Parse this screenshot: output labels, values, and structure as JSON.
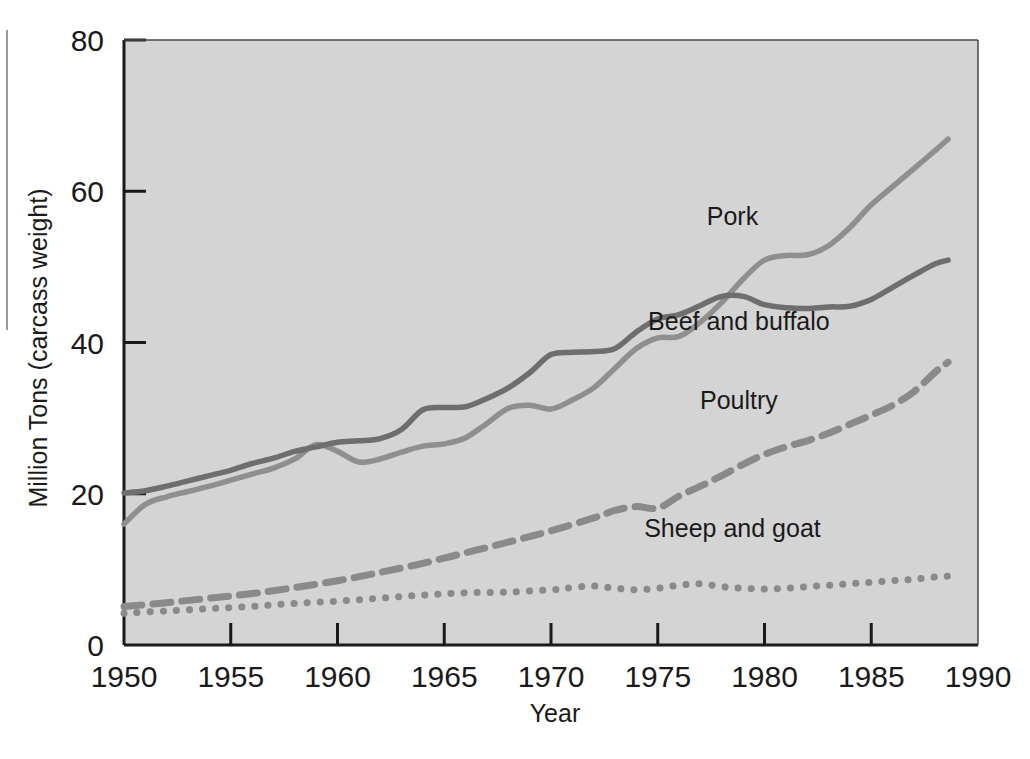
{
  "chart_data": {
    "type": "line",
    "title": "",
    "xlabel": "Year",
    "ylabel": "Million Tons (carcass weight)",
    "xlim": [
      1950,
      1990
    ],
    "ylim": [
      0,
      80
    ],
    "xticks": [
      "1950",
      "1955",
      "1960",
      "1965",
      "1970",
      "1975",
      "1980",
      "1985",
      "1990"
    ],
    "yticks": [
      "0",
      "20",
      "40",
      "60",
      "80"
    ],
    "grid": false,
    "legend_position": "inline-annotations",
    "plot_background": "#d4d4d4",
    "series": [
      {
        "name": "Pork",
        "label": "Pork",
        "style": "solid",
        "color": "#8f8f8f",
        "x": [
          1950,
          1951,
          1952,
          1953,
          1954,
          1955,
          1956,
          1957,
          1958,
          1959,
          1960,
          1961,
          1962,
          1963,
          1964,
          1965,
          1966,
          1967,
          1968,
          1969,
          1970,
          1971,
          1972,
          1973,
          1974,
          1975,
          1976,
          1977,
          1978,
          1979,
          1980,
          1981,
          1982,
          1983,
          1984,
          1985,
          1986,
          1987,
          1988,
          1988.6
        ],
        "values": [
          16.0,
          18.6,
          19.6,
          20.3,
          21.0,
          21.8,
          22.6,
          23.4,
          24.6,
          26.5,
          25.6,
          24.2,
          24.6,
          25.5,
          26.3,
          26.6,
          27.4,
          29.3,
          31.3,
          31.7,
          31.2,
          32.4,
          34.0,
          36.6,
          39.2,
          40.6,
          40.8,
          42.7,
          45.3,
          48.4,
          50.9,
          51.5,
          51.6,
          52.8,
          55.2,
          58.2,
          60.6,
          63.0,
          65.4,
          66.9
        ]
      },
      {
        "name": "Beef and buffalo",
        "label": "Beef and buffalo",
        "style": "solid",
        "color": "#6e6e6e",
        "x": [
          1950,
          1951,
          1952,
          1953,
          1954,
          1955,
          1956,
          1957,
          1958,
          1959,
          1960,
          1961,
          1962,
          1963,
          1964,
          1965,
          1966,
          1967,
          1968,
          1969,
          1970,
          1971,
          1972,
          1973,
          1974,
          1975,
          1976,
          1977,
          1978,
          1979,
          1980,
          1981,
          1982,
          1983,
          1984,
          1985,
          1986,
          1987,
          1988,
          1988.6
        ],
        "values": [
          20.1,
          20.4,
          21.0,
          21.7,
          22.4,
          23.1,
          24.0,
          24.7,
          25.6,
          26.2,
          26.8,
          27.0,
          27.3,
          28.5,
          31.1,
          31.4,
          31.5,
          32.6,
          34.0,
          36.0,
          38.4,
          38.7,
          38.8,
          39.2,
          41.4,
          43.1,
          43.7,
          44.9,
          46.1,
          46.1,
          45.0,
          44.6,
          44.5,
          44.7,
          44.8,
          45.7,
          47.3,
          48.9,
          50.4,
          50.9
        ]
      },
      {
        "name": "Poultry",
        "label": "Poultry",
        "style": "dashed",
        "color": "#8a8a8a",
        "x": [
          1950,
          1952,
          1954,
          1956,
          1958,
          1960,
          1962,
          1964,
          1966,
          1968,
          1970,
          1972,
          1973,
          1974,
          1975,
          1976,
          1977,
          1978,
          1979,
          1980,
          1981,
          1982,
          1983,
          1984,
          1985,
          1986,
          1987,
          1988,
          1988.6
        ],
        "values": [
          5.1,
          5.6,
          6.2,
          6.8,
          7.6,
          8.5,
          9.6,
          10.8,
          12.2,
          13.6,
          15.1,
          16.8,
          17.8,
          18.3,
          18.1,
          19.7,
          21.0,
          22.4,
          23.9,
          25.2,
          26.2,
          27.0,
          28.0,
          29.2,
          30.4,
          31.7,
          33.5,
          36.1,
          37.4
        ]
      },
      {
        "name": "Sheep and goat",
        "label": "Sheep and goat",
        "style": "dotted",
        "color": "#8a8a8a",
        "x": [
          1950,
          1952,
          1954,
          1956,
          1958,
          1960,
          1962,
          1964,
          1966,
          1968,
          1970,
          1971,
          1972,
          1973,
          1974,
          1975,
          1976,
          1977,
          1978,
          1979,
          1980,
          1981,
          1982,
          1983,
          1984,
          1985,
          1986,
          1987,
          1988,
          1988.6
        ],
        "values": [
          4.2,
          4.5,
          4.8,
          5.1,
          5.5,
          5.8,
          6.2,
          6.6,
          6.9,
          7.0,
          7.3,
          7.6,
          7.8,
          7.5,
          7.3,
          7.5,
          7.9,
          8.1,
          7.7,
          7.5,
          7.4,
          7.5,
          7.7,
          7.9,
          8.1,
          8.3,
          8.5,
          8.7,
          9.0,
          9.1
        ]
      }
    ],
    "annotations": [
      {
        "text": "Pork",
        "x": 1978.5,
        "y": 55.5
      },
      {
        "text": "Beef and buffalo",
        "x": 1978.8,
        "y": 41.6
      },
      {
        "text": "Poultry",
        "x": 1978.8,
        "y": 31.2
      },
      {
        "text": "Sheep and goat",
        "x": 1978.5,
        "y": 14.3
      }
    ]
  }
}
